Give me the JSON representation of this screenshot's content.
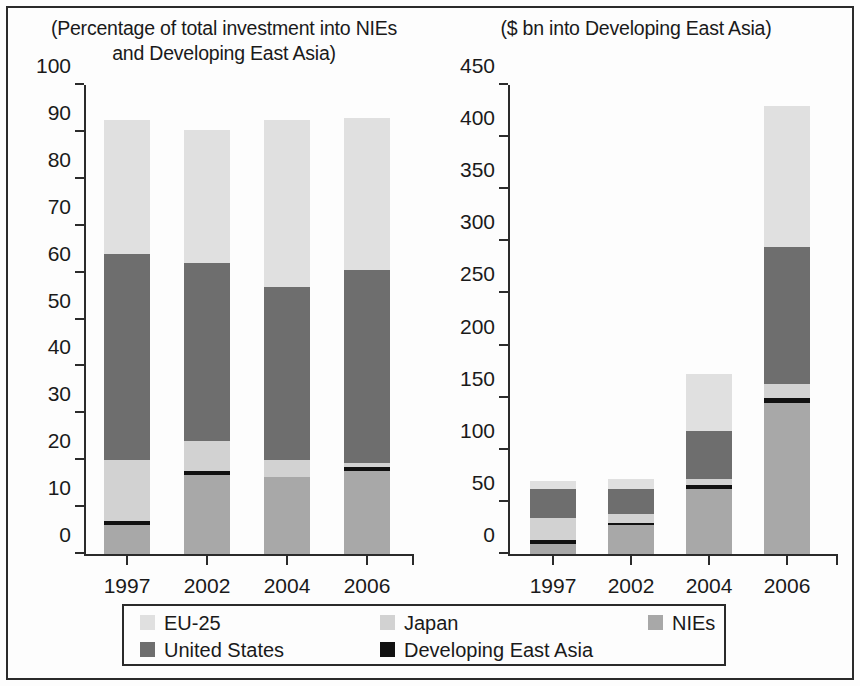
{
  "figure": {
    "background": "#fdfdfd",
    "frame_color": "#2b2b2b"
  },
  "series_colors": {
    "EU-25": "#e0e0e0",
    "United States": "#6e6e6e",
    "Japan": "#d2d2d2",
    "Developing East Asia": "#111111",
    "NIEs": "#a8a8a8"
  },
  "legend": {
    "items": [
      {
        "label": "EU-25",
        "color": "#e0e0e0"
      },
      {
        "label": "Japan",
        "color": "#d2d2d2"
      },
      {
        "label": "NIEs",
        "color": "#a8a8a8"
      },
      {
        "label": "United States",
        "color": "#6e6e6e"
      },
      {
        "label": "Developing East Asia",
        "color": "#111111"
      }
    ]
  },
  "chart_data": [
    {
      "type": "bar",
      "id": "left",
      "stacked": true,
      "title": "(Percentage of total investment into NIEs\nand Developing East Asia)",
      "xlabel": "",
      "ylabel": "",
      "ylim": [
        0,
        100
      ],
      "yticks": [
        0,
        10,
        20,
        30,
        40,
        50,
        60,
        70,
        80,
        90,
        100
      ],
      "ytick_labels": [
        "0",
        "10",
        "20",
        "30",
        "40",
        "50",
        "60",
        "70",
        "80",
        "90",
        "100"
      ],
      "grid": false,
      "legend_position": "bottom",
      "categories": [
        "1997",
        "2002",
        "2004",
        "2006"
      ],
      "series": [
        {
          "name": "NIEs",
          "values": [
            6.2,
            16.8,
            16.5,
            17.6
          ]
        },
        {
          "name": "Developing East Asia",
          "values": [
            0.9,
            0.8,
            0.0,
            0.9
          ]
        },
        {
          "name": "Japan",
          "values": [
            12.9,
            6.4,
            3.5,
            1.0
          ]
        },
        {
          "name": "United States",
          "values": [
            44.0,
            38.0,
            37.0,
            41.0
          ]
        },
        {
          "name": "EU-25",
          "values": [
            28.5,
            28.5,
            35.5,
            32.5
          ]
        }
      ],
      "totals": [
        92.5,
        90.5,
        92.5,
        93.0
      ]
    },
    {
      "type": "bar",
      "id": "right",
      "stacked": true,
      "title": "($ bn into Developing East Asia)",
      "xlabel": "",
      "ylabel": "",
      "ylim": [
        0,
        450
      ],
      "yticks": [
        0,
        50,
        100,
        150,
        200,
        250,
        300,
        350,
        400,
        450
      ],
      "ytick_labels": [
        "0",
        "50",
        "100",
        "150",
        "200",
        "250",
        "300",
        "350",
        "400",
        "450"
      ],
      "grid": false,
      "legend_position": "bottom",
      "categories": [
        "1997",
        "2002",
        "2004",
        "2006"
      ],
      "series": [
        {
          "name": "NIEs",
          "values": [
            10,
            28,
            62,
            145
          ]
        },
        {
          "name": "Developing East Asia",
          "values": [
            3,
            2,
            4,
            5
          ]
        },
        {
          "name": "Japan",
          "values": [
            22,
            8,
            6,
            13
          ]
        },
        {
          "name": "United States",
          "values": [
            27,
            24,
            46,
            132
          ]
        },
        {
          "name": "EU-25",
          "values": [
            8,
            10,
            55,
            135
          ]
        }
      ],
      "totals": [
        70,
        72,
        173,
        430
      ]
    }
  ]
}
